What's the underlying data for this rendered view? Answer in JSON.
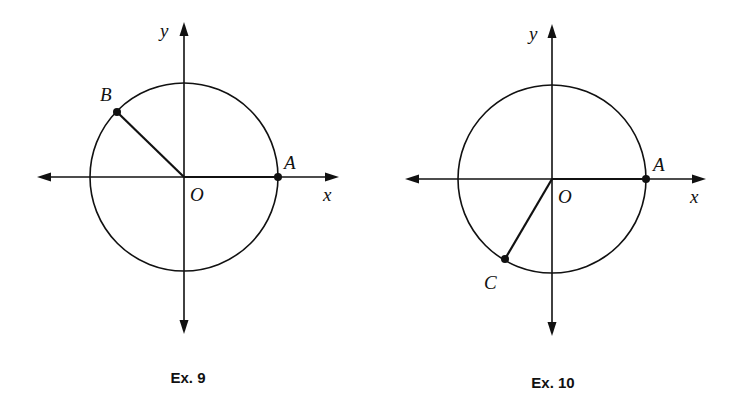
{
  "colors": {
    "ink": "#111111",
    "background": "#ffffff"
  },
  "figures": [
    {
      "caption": "Ex. 9",
      "axis_labels": {
        "x": "x",
        "y": "y"
      },
      "origin_label": "O",
      "center": [
        184,
        177
      ],
      "radius": 94,
      "points": [
        {
          "label": "A",
          "xy": [
            278,
            177
          ],
          "label_xy": [
            284,
            169
          ]
        },
        {
          "label": "B",
          "xy": [
            117,
            112
          ],
          "label_xy": [
            100,
            101
          ]
        }
      ],
      "radius_segments": [
        "A",
        "B"
      ]
    },
    {
      "caption": "Ex. 10",
      "axis_labels": {
        "x": "x",
        "y": "y"
      },
      "origin_label": "O",
      "center": [
        552,
        179
      ],
      "radius": 94,
      "points": [
        {
          "label": "A",
          "xy": [
            646,
            179
          ],
          "label_xy": [
            653,
            171
          ]
        },
        {
          "label": "C",
          "xy": [
            505,
            259
          ],
          "label_xy": [
            484,
            289
          ]
        }
      ],
      "radius_segments": [
        "A",
        "C"
      ]
    }
  ]
}
